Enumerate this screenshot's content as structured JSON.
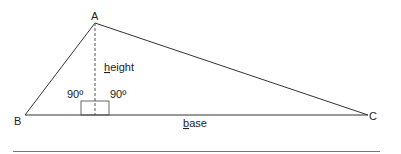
{
  "diagram": {
    "vertices": {
      "A": {
        "label": "A"
      },
      "B": {
        "label": "B"
      },
      "C": {
        "label": "C"
      }
    },
    "height_label_underlined": "h",
    "height_label_rest": "eight",
    "base_label_underlined": "b",
    "base_label_rest": "ase",
    "angle_left": "90º",
    "angle_right": "90º",
    "colors": {
      "line": "#333333",
      "dashed": "#555555",
      "rule": "#777777",
      "text": "#222222"
    }
  }
}
